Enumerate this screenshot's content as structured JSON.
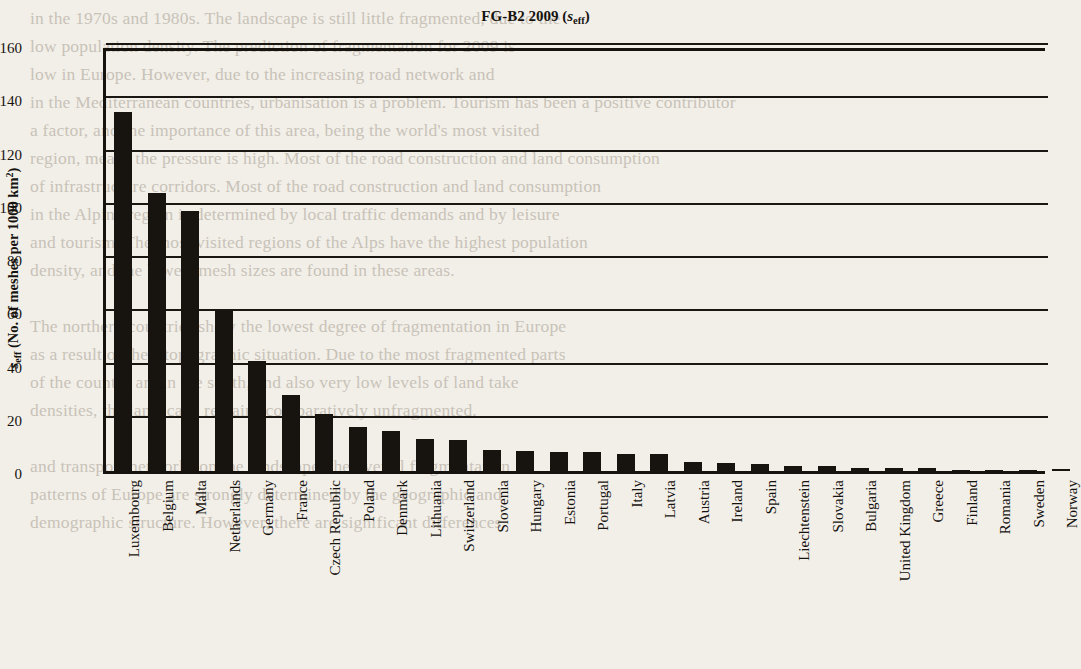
{
  "figure": {
    "title_main": "FG-B2 2009",
    "title_paren_open": "(",
    "title_symbol": "s",
    "title_symbol_sub": "eff",
    "title_paren_close": ")",
    "y_axis_symbol": "s",
    "y_axis_symbol_sub": "eff",
    "y_axis_text": " (No. of meshes per 1000 km",
    "y_axis_sup": "2",
    "y_axis_text_end": ")"
  },
  "chart_data": {
    "type": "bar",
    "xlabel": "",
    "ylabel": "s_eff (No. of meshes per 1000 km2)",
    "ylim": [
      0,
      160
    ],
    "yticks": [
      0,
      20,
      40,
      60,
      80,
      100,
      120,
      140,
      160
    ],
    "ytick_labels": [
      "0",
      "20",
      "40",
      "60",
      "80",
      "100",
      "120",
      "140",
      "160"
    ],
    "grid": true,
    "legend": null,
    "bar_color": "#17130f",
    "categories": [
      "Luxembourg",
      "Belgium",
      "Malta",
      "Netherlands",
      "Germany",
      "France",
      "Czech Republic",
      "Poland",
      "Denmark",
      "Lithuania",
      "Switzerland",
      "Slovenia",
      "Hungary",
      "Estonia",
      "Portugal",
      "Italy",
      "Latvia",
      "Austria",
      "Ireland",
      "Spain",
      "Liechtenstein",
      "Slovakia",
      "Bulgaria",
      "United Kingdom",
      "Greece",
      "Finland",
      "Romania",
      "Sweden",
      "Norway"
    ],
    "values": [
      135,
      104.5,
      97.5,
      60,
      41.5,
      28.5,
      21.5,
      16.5,
      15,
      12,
      11.5,
      8,
      7.5,
      7,
      7,
      6.5,
      6.5,
      3.5,
      3,
      2.5,
      2,
      1.8,
      1.2,
      1,
      1,
      0.4,
      0.4,
      0.5,
      0.6
    ]
  },
  "background_text": {
    "lines": [
      "in the 1970s and 1980s. The landscape is still little fragmented, due to the",
      "low population density. The prediction of fragmentation for 2009 is",
      "low in Europe. However, due to the increasing road network and",
      "in the Mediterranean countries, urbanisation is a problem. Tourism has been a positive contributor",
      "a factor, and the importance of this area, being the world's most visited",
      "region, means the pressure is high. Most of the road construction and land consumption",
      "of infrastructure corridors. Most of the road construction and land consumption",
      "in the Alpine region is determined by local traffic demands and by leisure",
      "and tourism. The most visited regions of the Alps have the highest population",
      "density, and the lowest mesh sizes are found in these areas.",
      "",
      "The northern countries show the lowest degree of fragmentation in Europe",
      "as a result of their topographic situation. Due to the most fragmented parts",
      "of the country are in the south, and also very low levels of land take",
      "densities, the landscape remains comparatively unfragmented.",
      "",
      "and transport networks on the landscape, the overall fragmentation",
      "patterns of Europe are strongly determined by the geographic and",
      "demographic structure. However, there are significant differences"
    ]
  }
}
